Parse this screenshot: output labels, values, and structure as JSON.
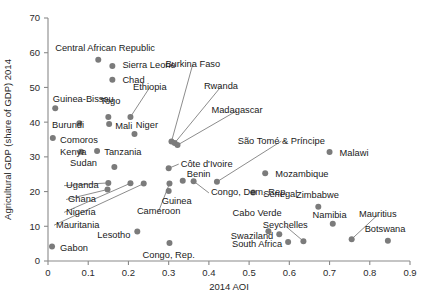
{
  "chart_data": {
    "type": "scatter",
    "title": "",
    "xlabel": "2014 AOI",
    "ylabel": "Agricultural GDP (share of GDP) 2014",
    "xlim": [
      0,
      0.9
    ],
    "ylim": [
      0,
      70
    ],
    "xticks": [
      "0",
      "0.1",
      "0.2",
      "0.3",
      "0.4",
      "0.5",
      "0.6",
      "0.7",
      "0.8",
      "0.9"
    ],
    "xtick_values": [
      0,
      0.1,
      0.2,
      0.3,
      0.4,
      0.5,
      0.6,
      0.7,
      0.8,
      0.9
    ],
    "yticks": [
      "0",
      "10",
      "20",
      "30",
      "40",
      "50",
      "60",
      "70"
    ],
    "ytick_values": [
      0,
      10,
      20,
      30,
      40,
      50,
      60,
      70
    ],
    "grid": false,
    "legend": "none",
    "marker_color": "#7b7b7b",
    "points": [
      {
        "name": "Central African Republic",
        "x": 0.125,
        "y": 58.0,
        "lx": 0.018,
        "ly": 61.5,
        "anchor": "start",
        "leader": false
      },
      {
        "name": "Sierra Leone",
        "x": 0.16,
        "y": 56.2,
        "lx": 0.185,
        "ly": 56.5,
        "anchor": "start",
        "leader": false
      },
      {
        "name": "Chad",
        "x": 0.16,
        "y": 52.2,
        "lx": 0.185,
        "ly": 52.3,
        "anchor": "start",
        "leader": false
      },
      {
        "name": "Guinea-Bissau",
        "x": 0.018,
        "y": 44.0,
        "lx": 0.012,
        "ly": 46.8,
        "anchor": "start",
        "leader": false
      },
      {
        "name": "Togo",
        "x": 0.15,
        "y": 41.5,
        "lx": 0.155,
        "ly": 46.2,
        "anchor": "middle",
        "leader": false
      },
      {
        "name": "Burundi",
        "x": 0.078,
        "y": 39.7,
        "lx": 0.01,
        "ly": 39.3,
        "anchor": "start",
        "leader": false
      },
      {
        "name": "Mali",
        "x": 0.152,
        "y": 39.5,
        "lx": 0.167,
        "ly": 39.0,
        "anchor": "start",
        "leader": false
      },
      {
        "name": "Ethiopia",
        "x": 0.205,
        "y": 41.5,
        "lx": 0.253,
        "ly": 50.3,
        "anchor": "middle",
        "leader": true
      },
      {
        "name": "Niger",
        "x": 0.215,
        "y": 36.6,
        "lx": 0.246,
        "ly": 39.2,
        "anchor": "middle",
        "leader": false
      },
      {
        "name": "Comoros",
        "x": 0.012,
        "y": 35.4,
        "lx": 0.03,
        "ly": 34.9,
        "anchor": "start",
        "leader": false
      },
      {
        "name": "Kenya",
        "x": 0.082,
        "y": 31.5,
        "lx": 0.03,
        "ly": 31.5,
        "anchor": "start",
        "leader": false
      },
      {
        "name": "Tanzania",
        "x": 0.122,
        "y": 31.7,
        "lx": 0.14,
        "ly": 31.4,
        "anchor": "start",
        "leader": false
      },
      {
        "name": "Burkina Faso",
        "x": 0.307,
        "y": 34.4,
        "lx": 0.36,
        "ly": 57.0,
        "anchor": "middle",
        "leader": true
      },
      {
        "name": "Rwanda",
        "x": 0.315,
        "y": 34.0,
        "lx": 0.43,
        "ly": 50.5,
        "anchor": "middle",
        "leader": true
      },
      {
        "name": "Madagascar",
        "x": 0.322,
        "y": 33.4,
        "lx": 0.47,
        "ly": 43.6,
        "anchor": "middle",
        "leader": true
      },
      {
        "name": "São Tomé & Príncipe",
        "x": 0.42,
        "y": 22.8,
        "lx": 0.58,
        "ly": 34.8,
        "anchor": "middle",
        "leader": true
      },
      {
        "name": "Malawi",
        "x": 0.7,
        "y": 31.4,
        "lx": 0.725,
        "ly": 31.3,
        "anchor": "start",
        "leader": false
      },
      {
        "name": "Sudan",
        "x": 0.165,
        "y": 27.1,
        "lx": 0.055,
        "ly": 28.3,
        "anchor": "start",
        "leader": false
      },
      {
        "name": "Côte d'Ivoire",
        "x": 0.3,
        "y": 26.7,
        "lx": 0.33,
        "ly": 28.2,
        "anchor": "start",
        "leader": true
      },
      {
        "name": "Benin",
        "x": 0.335,
        "y": 23.1,
        "lx": 0.345,
        "ly": 25.2,
        "anchor": "start",
        "leader": false
      },
      {
        "name": "Mozambique",
        "x": 0.54,
        "y": 25.3,
        "lx": 0.565,
        "ly": 25.2,
        "anchor": "start",
        "leader": false
      },
      {
        "name": "Uganda",
        "x": 0.15,
        "y": 22.5,
        "lx": 0.045,
        "ly": 22.0,
        "anchor": "start",
        "leader": true
      },
      {
        "name": "Ghana",
        "x": 0.148,
        "y": 20.6,
        "lx": 0.05,
        "ly": 18.0,
        "anchor": "start",
        "leader": true
      },
      {
        "name": "Nigeria",
        "x": 0.205,
        "y": 22.4,
        "lx": 0.045,
        "ly": 14.3,
        "anchor": "start",
        "leader": true
      },
      {
        "name": "Mauritania",
        "x": 0.238,
        "y": 22.3,
        "lx": 0.02,
        "ly": 10.6,
        "anchor": "start",
        "leader": true
      },
      {
        "name": "Cameroon",
        "x": 0.302,
        "y": 22.3,
        "lx": 0.275,
        "ly": 14.6,
        "anchor": "middle",
        "leader": true
      },
      {
        "name": "Guinea",
        "x": 0.3,
        "y": 20.2,
        "lx": 0.32,
        "ly": 17.4,
        "anchor": "middle",
        "leader": false
      },
      {
        "name": "Congo, Dem. Rep.",
        "x": 0.362,
        "y": 23.0,
        "lx": 0.405,
        "ly": 19.9,
        "anchor": "start",
        "leader": true
      },
      {
        "name": "Senegal",
        "x": 0.51,
        "y": 19.7,
        "lx": 0.535,
        "ly": 19.5,
        "anchor": "start",
        "leader": false
      },
      {
        "name": "Zimbabwe",
        "x": 0.672,
        "y": 15.6,
        "lx": 0.67,
        "ly": 19.2,
        "anchor": "middle",
        "leader": false
      },
      {
        "name": "Cabo Verde",
        "x": 0.548,
        "y": 8.6,
        "lx": 0.52,
        "ly": 13.8,
        "anchor": "middle",
        "leader": false
      },
      {
        "name": "Namibia",
        "x": 0.708,
        "y": 10.7,
        "lx": 0.7,
        "ly": 13.5,
        "anchor": "middle",
        "leader": false
      },
      {
        "name": "Mauritius",
        "x": 0.755,
        "y": 6.3,
        "lx": 0.82,
        "ly": 13.6,
        "anchor": "middle",
        "leader": true
      },
      {
        "name": "Seychelles",
        "x": 0.635,
        "y": 5.7,
        "lx": 0.59,
        "ly": 10.4,
        "anchor": "middle",
        "leader": true
      },
      {
        "name": "Swaziland",
        "x": 0.575,
        "y": 7.7,
        "lx": 0.56,
        "ly": 7.4,
        "anchor": "end",
        "leader": false
      },
      {
        "name": "Botswana",
        "x": 0.845,
        "y": 5.8,
        "lx": 0.838,
        "ly": 9.3,
        "anchor": "middle",
        "leader": false
      },
      {
        "name": "South Africa",
        "x": 0.597,
        "y": 5.5,
        "lx": 0.582,
        "ly": 5.1,
        "anchor": "end",
        "leader": false
      },
      {
        "name": "Lesotho",
        "x": 0.222,
        "y": 8.5,
        "lx": 0.205,
        "ly": 7.7,
        "anchor": "end",
        "leader": false
      },
      {
        "name": "Gabon",
        "x": 0.01,
        "y": 4.2,
        "lx": 0.03,
        "ly": 3.8,
        "anchor": "start",
        "leader": false
      },
      {
        "name": "Congo, Rep.",
        "x": 0.302,
        "y": 5.2,
        "lx": 0.3,
        "ly": 1.7,
        "anchor": "middle",
        "leader": false
      }
    ]
  }
}
